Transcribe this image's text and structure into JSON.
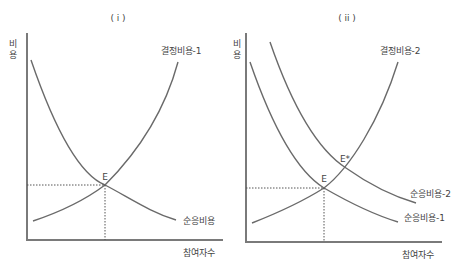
{
  "panels": [
    {
      "title": "( i )",
      "y_axis_label_line1": "비",
      "y_axis_label_line2": "용",
      "x_axis_label": "참여자수",
      "curves": [
        {
          "name": "결정비용-1",
          "type": "increasing"
        },
        {
          "name": "순응비용",
          "type": "decreasing"
        }
      ],
      "equilibrium_points": [
        {
          "label": "E"
        }
      ]
    },
    {
      "title": "( ii )",
      "y_axis_label_line1": "비",
      "y_axis_label_line2": "용",
      "x_axis_label": "참여자수",
      "curves": [
        {
          "name": "결정비용-2",
          "type": "increasing"
        },
        {
          "name": "순응비용-2",
          "type": "decreasing"
        },
        {
          "name": "순응비용-1",
          "type": "decreasing"
        }
      ],
      "equilibrium_points": [
        {
          "label": "E"
        },
        {
          "label": "E*"
        }
      ]
    }
  ],
  "colors": {
    "curve": "#6a6a6a",
    "axis": "#7a7a7a",
    "text": "#444444"
  }
}
